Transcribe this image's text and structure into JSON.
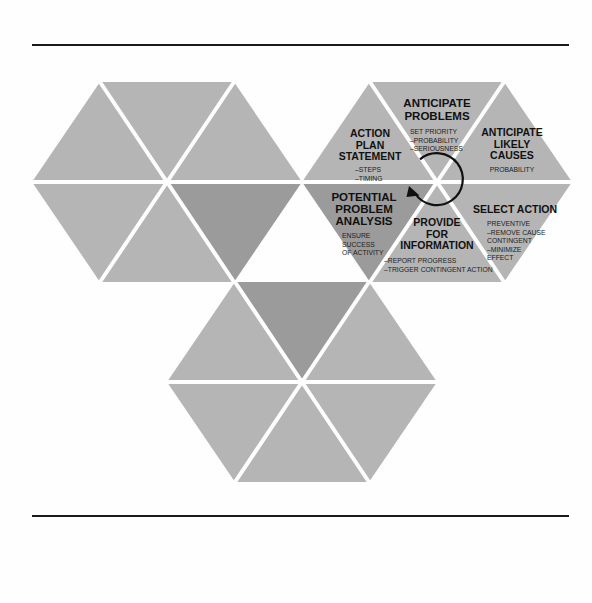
{
  "page": {
    "background_color": "#fefefe",
    "rule_color": "#1a1a1a"
  },
  "colors": {
    "triangle_light": "#b5b5b5",
    "triangle_dark": "#9b9b9b",
    "seam": "#fefefe",
    "text": "#111111"
  },
  "diagram": {
    "type": "hexagon-process-wheel",
    "center_arrow": {
      "icon": "circular-arrow-counterclockwise-icon",
      "direction": "counterclockwise"
    },
    "hexagons": [
      {
        "name": "left-hexagon",
        "labeled": false,
        "triangles": [
          {
            "position": "top-left",
            "shade": "light"
          },
          {
            "position": "top-right",
            "shade": "light"
          },
          {
            "position": "right",
            "shade": "dark"
          },
          {
            "position": "bottom-right",
            "shade": "light"
          },
          {
            "position": "bottom-left",
            "shade": "light"
          },
          {
            "position": "left",
            "shade": "light"
          }
        ]
      },
      {
        "name": "bottom-hexagon",
        "labeled": false,
        "triangles": [
          {
            "position": "top",
            "shade": "dark"
          },
          {
            "position": "top-right",
            "shade": "light"
          },
          {
            "position": "bottom-right",
            "shade": "light"
          },
          {
            "position": "bottom",
            "shade": "light"
          },
          {
            "position": "bottom-left",
            "shade": "light"
          },
          {
            "position": "top-left",
            "shade": "light"
          }
        ]
      },
      {
        "name": "main-hexagon",
        "labeled": true,
        "segments": [
          {
            "id": "anticipate-problems",
            "position": "top",
            "shade": "light",
            "heading": [
              "ANTICIPATE",
              "PROBLEMS"
            ],
            "sub": [
              "SET PRIORITY",
              "–PROBABILITY",
              "–SERIOUSNESS"
            ]
          },
          {
            "id": "anticipate-likely-causes",
            "position": "upper-right",
            "shade": "light",
            "heading": [
              "ANTICIPATE",
              "LIKELY",
              "CAUSES"
            ],
            "sub": [
              "PROBABILITY"
            ]
          },
          {
            "id": "select-action",
            "position": "lower-right",
            "shade": "light",
            "heading": [
              "SELECT ACTION"
            ],
            "sub": [
              "PREVENTIVE",
              "–REMOVE CAUSE",
              "CONTINGENT",
              "–MINIMIZE",
              "EFFECT"
            ]
          },
          {
            "id": "provide-for-information",
            "position": "bottom",
            "shade": "light",
            "heading": [
              "PROVIDE",
              "FOR",
              "INFORMATION"
            ],
            "sub": [
              "–REPORT PROGRESS",
              "–TRIGGER CONTINGENT ACTION"
            ]
          },
          {
            "id": "potential-problem-analysis",
            "position": "lower-left",
            "shade": "dark",
            "heading": [
              "POTENTIAL",
              "PROBLEM",
              "ANALYSIS"
            ],
            "sub": [
              "ENSURE",
              "SUCCESS",
              "OF ACTIVITY"
            ]
          },
          {
            "id": "action-plan-statement",
            "position": "upper-left",
            "shade": "light",
            "heading": [
              "ACTION",
              "PLAN",
              "STATEMENT"
            ],
            "sub": [
              "–STEPS",
              "–TIMING"
            ]
          }
        ]
      }
    ]
  },
  "labels": {
    "anticipate_problems": {
      "h1": "ANTICIPATE",
      "h2": "PROBLEMS",
      "s1": "SET PRIORITY",
      "s2": "–PROBABILITY",
      "s3": "–SERIOUSNESS"
    },
    "anticipate_likely_causes": {
      "h1": "ANTICIPATE",
      "h2": "LIKELY",
      "h3": "CAUSES",
      "s1": "PROBABILITY"
    },
    "select_action": {
      "h1": "SELECT ACTION",
      "s1": "PREVENTIVE",
      "s2": "–REMOVE CAUSE",
      "s3": "CONTINGENT",
      "s4": "–MINIMIZE",
      "s5": "EFFECT"
    },
    "provide_for_information": {
      "h1": "PROVIDE",
      "h2": "FOR",
      "h3": "INFORMATION",
      "s1": "–REPORT PROGRESS",
      "s2": "–TRIGGER CONTINGENT ACTION"
    },
    "potential_problem_analysis": {
      "h1": "POTENTIAL",
      "h2": "PROBLEM",
      "h3": "ANALYSIS",
      "s1": "ENSURE",
      "s2": "SUCCESS",
      "s3": "OF ACTIVITY"
    },
    "action_plan_statement": {
      "h1": "ACTION",
      "h2": "PLAN",
      "h3": "STATEMENT",
      "s1": "–STEPS",
      "s2": "–TIMING"
    }
  }
}
